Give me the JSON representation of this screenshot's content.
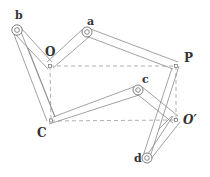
{
  "diagram": {
    "labels": {
      "O": "O",
      "a": "a",
      "b": "b",
      "P": "P",
      "c": "c",
      "C": "C",
      "O_prime": "O′",
      "d": "d"
    },
    "links": [
      {
        "from": "O",
        "to": "b"
      },
      {
        "from": "O",
        "to": "a"
      },
      {
        "from": "a",
        "to": "P"
      },
      {
        "from": "b",
        "to": "C"
      },
      {
        "from": "C",
        "to": "c"
      },
      {
        "from": "c",
        "to": "O_prime"
      },
      {
        "from": "d",
        "to": "P"
      },
      {
        "from": "d",
        "to": "O_prime"
      }
    ],
    "dashed_frame": [
      "O",
      "P",
      "O_prime",
      "C"
    ],
    "colors": {
      "line": "#8a8a8a",
      "label": "#333333",
      "background": "#ffffff"
    }
  }
}
